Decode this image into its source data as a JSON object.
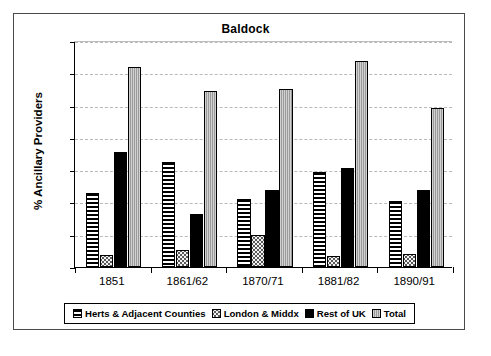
{
  "chart_data": {
    "type": "bar",
    "title": "Baldock",
    "xlabel": "",
    "ylabel": "% Ancillary Providers",
    "ylim": [
      0,
      35
    ],
    "ytick_step": 5,
    "yticks": [
      0,
      5,
      10,
      15,
      20,
      25,
      30,
      35
    ],
    "grid": true,
    "legend_position": "bottom",
    "categories": [
      "1851",
      "1861/62",
      "1870/71",
      "1881/82",
      "1890/91"
    ],
    "series": [
      {
        "name": "Herts & Adjacent Counties",
        "fill": "horizontal-stripes",
        "color": "#000000",
        "values": [
          11.4,
          16.3,
          10.5,
          14.7,
          10.2
        ]
      },
      {
        "name": "London & Middx",
        "fill": "dotted",
        "color": "#f2f2f2",
        "values": [
          1.8,
          2.7,
          4.9,
          1.7,
          2.0
        ]
      },
      {
        "name": "Rest of UK",
        "fill": "solid",
        "color": "#000000",
        "values": [
          17.8,
          8.2,
          12.0,
          15.3,
          11.9
        ]
      },
      {
        "name": "Total",
        "fill": "gray-hatch",
        "color": "#9a9a9a",
        "values": [
          31.0,
          27.2,
          27.6,
          31.9,
          24.6
        ]
      }
    ]
  },
  "legend": {
    "items": [
      {
        "label": "Herts & Adjacent Counties"
      },
      {
        "label": "London & Middx"
      },
      {
        "label": "Rest of UK"
      },
      {
        "label": "Total"
      }
    ]
  }
}
